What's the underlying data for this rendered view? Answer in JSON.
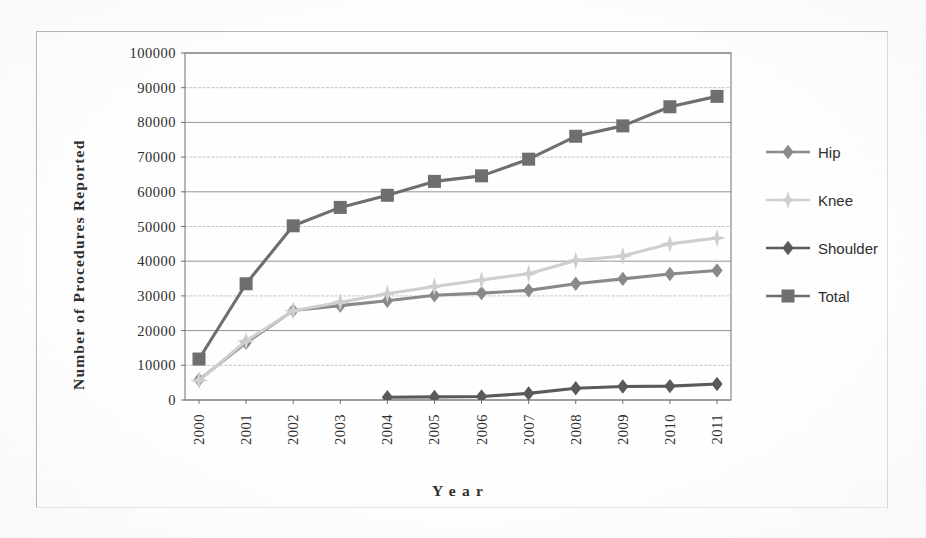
{
  "chart_data": {
    "type": "line",
    "title": "",
    "xlabel": "Year",
    "ylabel": "Number of Procedures Reported",
    "categories": [
      "2000",
      "2001",
      "2002",
      "2003",
      "2004",
      "2005",
      "2006",
      "2007",
      "2008",
      "2009",
      "2010",
      "2011"
    ],
    "ylim": [
      0,
      100000
    ],
    "ytick_step": 10000,
    "yticks": [
      "100000",
      "90000",
      "80000",
      "70000",
      "60000",
      "50000",
      "40000",
      "30000",
      "20000",
      "10000",
      "0"
    ],
    "grid": true,
    "grid_axis": "y",
    "legend_position": "right",
    "series": [
      {
        "name": "Hip",
        "marker": "diamond",
        "color": "#8a8a8a",
        "values": [
          5800,
          16500,
          25800,
          27200,
          28600,
          30200,
          30800,
          31600,
          33500,
          34900,
          36300,
          37300
        ]
      },
      {
        "name": "Knee",
        "marker": "star",
        "color": "#cfcfcf",
        "values": [
          5600,
          17000,
          25700,
          28200,
          30600,
          32700,
          34600,
          36400,
          40200,
          41500,
          45000,
          46700
        ]
      },
      {
        "name": "Shoulder",
        "marker": "diamond",
        "color": "#5a5a5a",
        "values": [
          null,
          null,
          null,
          null,
          800,
          900,
          1000,
          1900,
          3400,
          3900,
          4000,
          4600
        ]
      },
      {
        "name": "Total",
        "marker": "square",
        "color": "#6f6f6f",
        "values": [
          11800,
          33500,
          50200,
          55500,
          59000,
          63000,
          64600,
          69400,
          76000,
          79000,
          84500,
          87500
        ]
      }
    ]
  },
  "axis": {
    "y_title": "Number of Procedures Reported",
    "x_title": "Y e a r"
  },
  "legend": {
    "items": [
      {
        "label": "Hip"
      },
      {
        "label": "Knee"
      },
      {
        "label": "Shoulder"
      },
      {
        "label": "Total"
      }
    ]
  }
}
